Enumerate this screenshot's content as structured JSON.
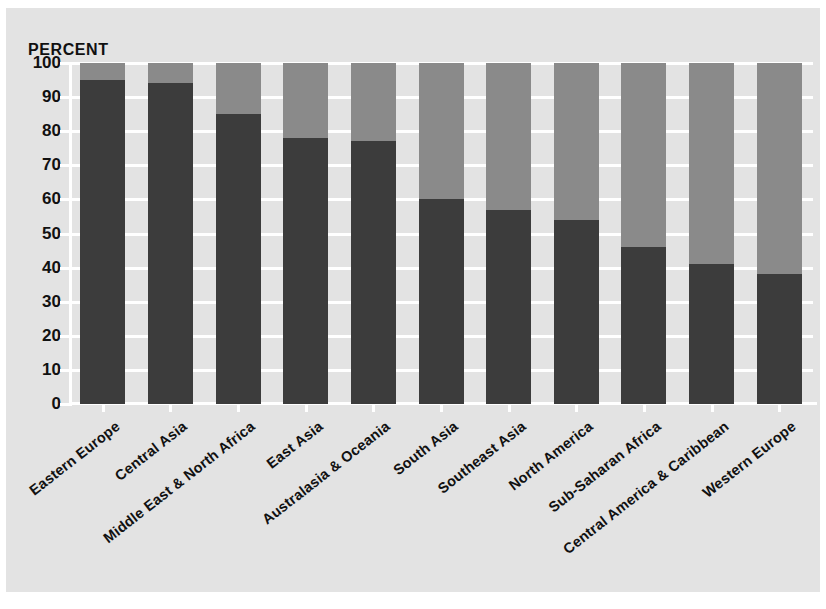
{
  "axis": {
    "y_title": "PERCENT",
    "y_ticks": [
      "100",
      "90",
      "80",
      "70",
      "60",
      "50",
      "40",
      "30",
      "20",
      "10",
      "0"
    ]
  },
  "colors": {
    "background": "#e3e3e3",
    "grid": "#ffffff",
    "segment_lower": "#3c3c3c",
    "segment_upper": "#8a8a8a",
    "text": "#111111"
  },
  "chart_data": {
    "type": "bar",
    "stacked": true,
    "title": "",
    "subtitle": "",
    "xlabel": "",
    "ylabel": "PERCENT",
    "ylim": [
      0,
      100
    ],
    "ytick_step": 10,
    "grid": true,
    "legend": null,
    "categories": [
      "Eastern Europe",
      "Central Asia",
      "Middle East & North Africa",
      "East Asia",
      "Australasia & Oceania",
      "South Asia",
      "Southeast Asia",
      "North America",
      "Sub-Saharan Africa",
      "Central America & Caribbean",
      "Western Europe"
    ],
    "series": [
      {
        "name": "lower-segment",
        "color": "#3c3c3c",
        "values": [
          95,
          94,
          85,
          78,
          77,
          60,
          57,
          54,
          46,
          41,
          38
        ]
      },
      {
        "name": "upper-segment",
        "color": "#8a8a8a",
        "values": [
          5,
          6,
          15,
          22,
          23,
          40,
          43,
          46,
          54,
          59,
          62
        ]
      }
    ]
  }
}
